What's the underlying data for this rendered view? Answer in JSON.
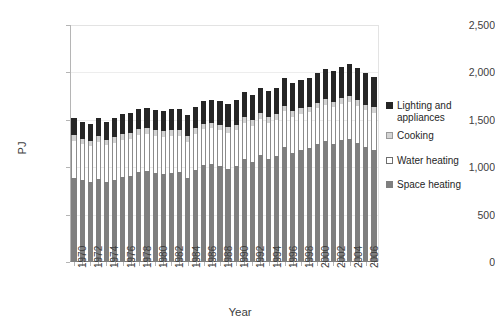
{
  "chart_data": {
    "type": "bar",
    "stacked": true,
    "title": "",
    "xlabel": "Year",
    "ylabel": "PJ",
    "ylim": [
      0,
      2500
    ],
    "ytick_labels": [
      "0",
      "500",
      "1,000",
      "1,500",
      "2,000",
      "2,500"
    ],
    "ytick_values": [
      0,
      500,
      1000,
      1500,
      2000,
      2500
    ],
    "grid": true,
    "legend_position": "right",
    "categories": [
      "1970",
      "1971",
      "1972",
      "1973",
      "1974",
      "1975",
      "1976",
      "1977",
      "1978",
      "1979",
      "1980",
      "1981",
      "1982",
      "1983",
      "1984",
      "1985",
      "1986",
      "1987",
      "1988",
      "1989",
      "1990",
      "1991",
      "1992",
      "1993",
      "1994",
      "1995",
      "1996",
      "1997",
      "1998",
      "1999",
      "2000",
      "2001",
      "2002",
      "2003",
      "2004",
      "2005",
      "2006",
      "2007"
    ],
    "xtick_labels": [
      "1970",
      "1972",
      "1974",
      "1976",
      "1978",
      "1980",
      "1982",
      "1984",
      "1986",
      "1988",
      "1990",
      "1992",
      "1994",
      "1996",
      "1998",
      "2000",
      "2002",
      "2004",
      "2006"
    ],
    "series": [
      {
        "name": "Space heating",
        "color": "#7f7f7f",
        "values": [
          890,
          860,
          840,
          880,
          840,
          870,
          900,
          910,
          950,
          960,
          940,
          930,
          940,
          950,
          890,
          970,
          1020,
          1030,
          1010,
          980,
          1010,
          1090,
          1060,
          1130,
          1090,
          1120,
          1210,
          1150,
          1180,
          1200,
          1240,
          1280,
          1250,
          1290,
          1300,
          1260,
          1210,
          1180
        ]
      },
      {
        "name": "Water heating",
        "color": "#ffffff",
        "values": [
          390,
          380,
          380,
          390,
          390,
          390,
          390,
          390,
          390,
          390,
          390,
          390,
          390,
          380,
          380,
          380,
          380,
          380,
          380,
          380,
          380,
          380,
          380,
          380,
          380,
          380,
          380,
          380,
          380,
          380,
          380,
          380,
          380,
          380,
          390,
          390,
          390,
          390
        ]
      },
      {
        "name": "Cooking",
        "color": "#d4d4d4",
        "values": [
          60,
          60,
          60,
          60,
          60,
          60,
          60,
          60,
          60,
          60,
          60,
          60,
          60,
          60,
          60,
          60,
          60,
          60,
          60,
          60,
          60,
          60,
          60,
          60,
          60,
          60,
          60,
          60,
          60,
          60,
          60,
          60,
          60,
          60,
          60,
          60,
          60,
          60
        ]
      },
      {
        "name": "Lighting and appliances",
        "color": "#262626",
        "values": [
          180,
          180,
          180,
          190,
          190,
          200,
          210,
          210,
          215,
          220,
          215,
          215,
          220,
          225,
          220,
          230,
          235,
          240,
          245,
          250,
          255,
          260,
          265,
          270,
          275,
          280,
          290,
          295,
          300,
          305,
          315,
          320,
          325,
          330,
          340,
          340,
          330,
          320
        ]
      }
    ],
    "legend": [
      {
        "label": "Lighting and appliances",
        "marker": "light"
      },
      {
        "label": "Cooking",
        "marker": "cooking"
      },
      {
        "label": "Water heating",
        "marker": "water"
      },
      {
        "label": "Space heating",
        "marker": "space"
      }
    ]
  }
}
